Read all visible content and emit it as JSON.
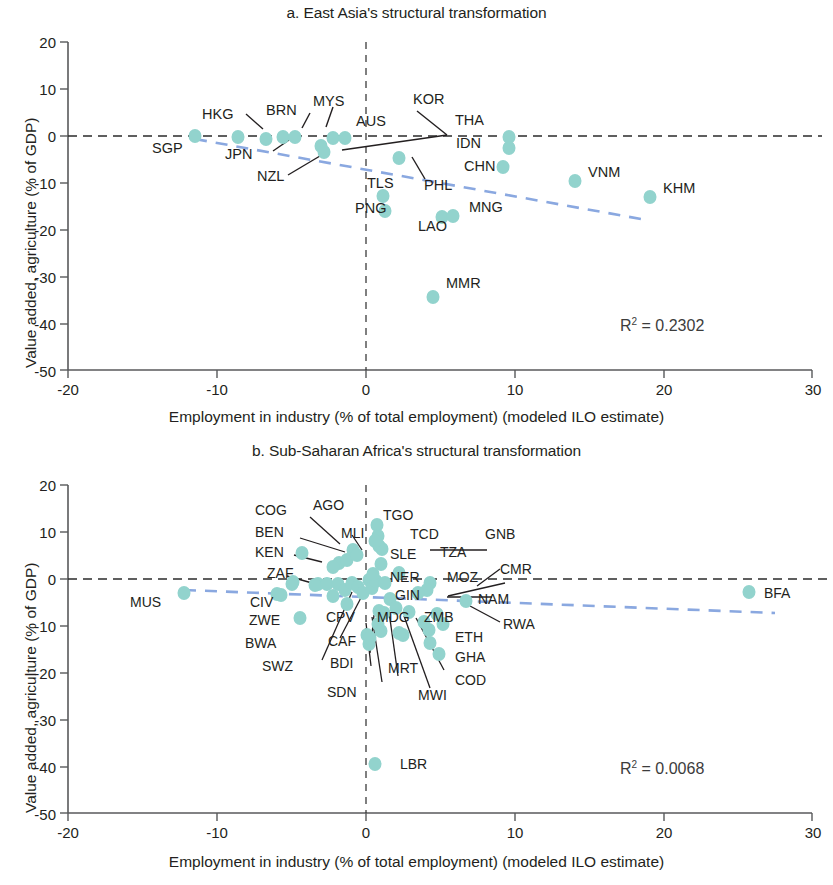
{
  "figure": {
    "axis_label_x": "Employment in industry (% of total employment) (modeled ILO estimate)",
    "axis_label_y": "Value added, agriculture (% of GDP)",
    "marker_color": "#92d3cd",
    "trendline_color": "#8aa8e0",
    "axis_color": "#58595b"
  },
  "chart_data": [
    {
      "type": "scatter",
      "panel": "a",
      "title": "a. East Asia's structural transformation",
      "xlabel": "Employment in industry (% of total employment) (modeled ILO estimate)",
      "ylabel": "Value added, agriculture (% of GDP)",
      "xlim": [
        -20,
        30
      ],
      "ylim": [
        -50,
        20
      ],
      "xticks": [
        -20,
        -10,
        0,
        10,
        20,
        30
      ],
      "yticks": [
        20,
        10,
        0,
        -10,
        -20,
        -30,
        -40,
        -50
      ],
      "grid": false,
      "r2_text": "R² = 0.2302",
      "r2_value": 0.2302,
      "reference_lines": {
        "horizontal_y": 0,
        "vertical_x": 0
      },
      "trendline": {
        "x": [
          -11.5,
          18.5
        ],
        "y": [
          -0.6,
          -17.6
        ]
      },
      "points": [
        {
          "code": "SGP",
          "x": -11.5,
          "y": 0.0
        },
        {
          "code": "HKG",
          "x": -8.6,
          "y": -0.1
        },
        {
          "code": "JPN",
          "x": -6.7,
          "y": -0.6
        },
        {
          "code": "BRN",
          "x": -5.6,
          "y": -0.3
        },
        {
          "code": "MYS",
          "x": -4.8,
          "y": -0.2
        },
        {
          "code": "NZL",
          "x": -3.0,
          "y": -2.1
        },
        {
          "code": "AUS",
          "x": -2.2,
          "y": -0.4
        },
        {
          "code": "KOR",
          "x": -2.4,
          "y": -1.4
        },
        {
          "code": "TLS",
          "x": 1.1,
          "y": -12.8
        },
        {
          "code": "PNG",
          "x": 1.2,
          "y": -16.1
        },
        {
          "code": "PHL",
          "x": 2.2,
          "y": -4.6
        },
        {
          "code": "MMR",
          "x": 3.4,
          "y": -34.2
        },
        {
          "code": "THA",
          "x": 4.8,
          "y": -0.4
        },
        {
          "code": "IDN",
          "x": 4.8,
          "y": -2.6
        },
        {
          "code": "CHN",
          "x": 4.6,
          "y": -6.7
        },
        {
          "code": "LAO",
          "x": 4.4,
          "y": -17.2
        },
        {
          "code": "MNG",
          "x": 5.0,
          "y": -17.0
        },
        {
          "code": "VNM",
          "x": 13.4,
          "y": -9.5
        },
        {
          "code": "KHM",
          "x": 18.4,
          "y": -12.9
        }
      ],
      "labels": [
        {
          "code": "SGP"
        },
        {
          "code": "HKG"
        },
        {
          "code": "JPN"
        },
        {
          "code": "BRN"
        },
        {
          "code": "MYS"
        },
        {
          "code": "NZL"
        },
        {
          "code": "AUS"
        },
        {
          "code": "KOR"
        },
        {
          "code": "TLS"
        },
        {
          "code": "PNG"
        },
        {
          "code": "PHL"
        },
        {
          "code": "MMR"
        },
        {
          "code": "THA"
        },
        {
          "code": "IDN"
        },
        {
          "code": "CHN"
        },
        {
          "code": "LAO"
        },
        {
          "code": "MNG"
        },
        {
          "code": "VNM"
        },
        {
          "code": "KHM"
        }
      ]
    },
    {
      "type": "scatter",
      "panel": "b",
      "title": "b. Sub-Saharan Africa's structural transformation",
      "xlabel": "Employment in industry (% of total employment) (modeled ILO estimate)",
      "ylabel": "Value added, agriculture (% of GDP)",
      "xlim": [
        -20,
        30
      ],
      "ylim": [
        -50,
        20
      ],
      "xticks": [
        -20,
        -10,
        0,
        10,
        20,
        30
      ],
      "yticks": [
        20,
        10,
        0,
        -10,
        -20,
        -30,
        -40,
        -50
      ],
      "grid": false,
      "r2_text": "R² = 0.0068",
      "r2_value": 0.0068,
      "reference_lines": {
        "horizontal_y": 0,
        "vertical_x": 0
      },
      "trendline": {
        "x": [
          -12.2,
          27.5
        ],
        "y": [
          -2.4,
          -7.2
        ]
      },
      "points": [
        {
          "code": "MUS",
          "x": -12.2,
          "y": -3.0
        },
        {
          "code": "KEN",
          "x": -4.3,
          "y": 5.6
        },
        {
          "code": "ZAF",
          "x": -5.0,
          "y": -1.1
        },
        {
          "code": "CIV",
          "x": -5.7,
          "y": -3.3
        },
        {
          "code": "ZWE",
          "x": -4.4,
          "y": -8.4
        },
        {
          "code": "COG",
          "x": -1.8,
          "y": 3.4
        },
        {
          "code": "AGO",
          "x": -1.3,
          "y": 4.0
        },
        {
          "code": "BEN",
          "x": -2.2,
          "y": 2.6
        },
        {
          "code": "MLI",
          "x": -0.9,
          "y": 6.2
        },
        {
          "code": "TGO",
          "x": 0.7,
          "y": 11.6
        },
        {
          "code": "TCD",
          "x": 0.8,
          "y": 9.2
        },
        {
          "code": "GNB",
          "x": 0.9,
          "y": 7.0
        },
        {
          "code": "SLE",
          "x": 1.0,
          "y": 3.2
        },
        {
          "code": "TZA",
          "x": 2.2,
          "y": 1.3
        },
        {
          "code": "NER",
          "x": 0.2,
          "y": -0.2
        },
        {
          "code": "MOZ",
          "x": 4.3,
          "y": -0.9
        },
        {
          "code": "CMR",
          "x": 4.1,
          "y": -2.4
        },
        {
          "code": "BWA",
          "x": -3.2,
          "y": -1.0
        },
        {
          "code": "SWZ",
          "x": -2.2,
          "y": -3.6
        },
        {
          "code": "CPV",
          "x": -1.3,
          "y": -5.4
        },
        {
          "code": "GIN",
          "x": 1.6,
          "y": -4.2
        },
        {
          "code": "NAM",
          "x": 6.7,
          "y": -4.6
        },
        {
          "code": "BFA",
          "x": 25.7,
          "y": -2.8
        },
        {
          "code": "MDG",
          "x": 0.8,
          "y": -9.5
        },
        {
          "code": "ZMB",
          "x": 2.9,
          "y": -7.0
        },
        {
          "code": "RWA",
          "x": 4.8,
          "y": -7.4
        },
        {
          "code": "CAF",
          "x": 0.1,
          "y": -11.9
        },
        {
          "code": "BDI",
          "x": 0.2,
          "y": -13.8
        },
        {
          "code": "SDN",
          "x": 0.3,
          "y": -12.6
        },
        {
          "code": "MRT",
          "x": 1.0,
          "y": -11.0
        },
        {
          "code": "MWI",
          "x": 2.5,
          "y": -12.0
        },
        {
          "code": "COD",
          "x": 4.2,
          "y": -10.8
        },
        {
          "code": "ETH",
          "x": 4.3,
          "y": -13.6
        },
        {
          "code": "GHA",
          "x": 4.9,
          "y": -16.0
        },
        {
          "code": "LBR",
          "x": 0.6,
          "y": -39.4
        },
        {
          "code": "",
          "x": -4.9,
          "y": -0.6
        },
        {
          "code": "",
          "x": -6.0,
          "y": -3.2
        },
        {
          "code": "",
          "x": -3.4,
          "y": -1.2
        },
        {
          "code": "",
          "x": -2.6,
          "y": -1.0
        },
        {
          "code": "",
          "x": -1.9,
          "y": -1.1
        },
        {
          "code": "",
          "x": -1.4,
          "y": -2.4
        },
        {
          "code": "",
          "x": -0.9,
          "y": -0.9
        },
        {
          "code": "",
          "x": -0.5,
          "y": -1.8
        },
        {
          "code": "",
          "x": -0.2,
          "y": -3.1
        },
        {
          "code": "",
          "x": 0.4,
          "y": -2.0
        },
        {
          "code": "",
          "x": 0.7,
          "y": -0.5
        },
        {
          "code": "",
          "x": 1.3,
          "y": -0.9
        },
        {
          "code": "",
          "x": 0.5,
          "y": 1.0
        },
        {
          "code": "",
          "x": 1.1,
          "y": 6.4
        },
        {
          "code": "",
          "x": 0.6,
          "y": 8.0
        },
        {
          "code": "",
          "x": -0.6,
          "y": 5.2
        },
        {
          "code": "",
          "x": 3.5,
          "y": -3.1
        },
        {
          "code": "",
          "x": 2.0,
          "y": -6.3
        },
        {
          "code": "",
          "x": 1.2,
          "y": -7.3
        },
        {
          "code": "",
          "x": 3.9,
          "y": -9.2
        },
        {
          "code": "",
          "x": 5.2,
          "y": -9.6
        },
        {
          "code": "",
          "x": 2.2,
          "y": -11.5
        },
        {
          "code": "",
          "x": 0.9,
          "y": -6.9
        }
      ]
    }
  ],
  "panel_a": {
    "title": "a. East Asia's structural transformation",
    "r2": "R² = 0.2302",
    "ytick_labels": [
      "20",
      "10",
      "0",
      "-10",
      "-20",
      "-30",
      "-40",
      "-50"
    ],
    "xtick_labels": [
      "-20",
      "-10",
      "0",
      "10",
      "20",
      "30"
    ],
    "codes": {
      "SGP": "SGP",
      "HKG": "HKG",
      "JPN": "JPN",
      "BRN": "BRN",
      "MYS": "MYS",
      "NZL": "NZL",
      "AUS": "AUS",
      "KOR": "KOR",
      "TLS": "TLS",
      "PNG": "PNG",
      "PHL": "PHL",
      "MMR": "MMR",
      "THA": "THA",
      "IDN": "IDN",
      "CHN": "CHN",
      "LAO": "LAO",
      "MNG": "MNG",
      "VNM": "VNM",
      "KHM": "KHM"
    }
  },
  "panel_b": {
    "title": "b. Sub-Saharan Africa's structural transformation",
    "r2": "R² = 0.0068",
    "ytick_labels": [
      "20",
      "10",
      "0",
      "-10",
      "-20",
      "-30",
      "-40",
      "-50"
    ],
    "xtick_labels": [
      "-20",
      "-10",
      "0",
      "10",
      "20",
      "30"
    ],
    "codes": {
      "COG": "COG",
      "AGO": "AGO",
      "BEN": "BEN",
      "KEN": "KEN",
      "ZAF": "ZAF",
      "MLI": "MLI",
      "TGO": "TGO",
      "TCD": "TCD",
      "GNB": "GNB",
      "SLE": "SLE",
      "TZA": "TZA",
      "CMR": "CMR",
      "NER": "NER",
      "MOZ": "MOZ",
      "MUS": "MUS",
      "CIV": "CIV",
      "GIN": "GIN",
      "NAM": "NAM",
      "BFA": "BFA",
      "ZWE": "ZWE",
      "CPV": "CPV",
      "MDG": "MDG",
      "ZMB": "ZMB",
      "RWA": "RWA",
      "BWA": "BWA",
      "CAF": "CAF",
      "ETH": "ETH",
      "GHA": "GHA",
      "SWZ": "SWZ",
      "BDI": "BDI",
      "MRT": "MRT",
      "COD": "COD",
      "SDN": "SDN",
      "MWI": "MWI",
      "LBR": "LBR"
    }
  }
}
